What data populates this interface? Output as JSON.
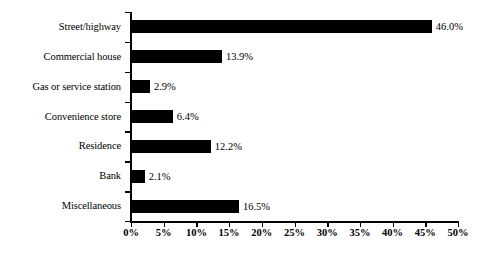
{
  "chart_data": {
    "type": "bar",
    "orientation": "horizontal",
    "title": "",
    "xlabel": "",
    "ylabel": "",
    "categories": [
      "Street/highway",
      "Commercial house",
      "Gas or service station",
      "Convenience store",
      "Residence",
      "Bank",
      "Miscellaneous"
    ],
    "values": [
      46.0,
      13.9,
      2.9,
      6.4,
      12.2,
      2.1,
      16.5
    ],
    "value_labels": [
      "46.0%",
      "13.9%",
      "2.9%",
      "6.4%",
      "12.2%",
      "2.1%",
      "16.5%"
    ],
    "xlim": [
      0,
      50
    ],
    "xtick_values": [
      0,
      5,
      10,
      15,
      20,
      25,
      30,
      35,
      40,
      45,
      50
    ],
    "xtick_labels": [
      "0%",
      "5%",
      "10%",
      "15%",
      "20%",
      "25%",
      "30%",
      "35%",
      "40%",
      "45%",
      "50%"
    ],
    "grid": false,
    "legend": false,
    "bar_color": "#000000",
    "background_color": "#ffffff",
    "axis_color": "#000000"
  }
}
